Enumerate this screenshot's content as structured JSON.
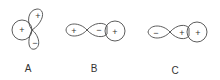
{
  "diagrams": [
    {
      "label": "A",
      "signs": {
        "left_sphere": "+",
        "upper_lobe": "+",
        "lower_lobe": "−"
      }
    },
    {
      "label": "B",
      "signs": {
        "left_lobe": "+",
        "right_lobe": "−",
        "sphere": "+"
      }
    },
    {
      "label": "C",
      "signs": {
        "left_lobe": "−",
        "right_lobe": "+",
        "sphere": "+"
      }
    }
  ],
  "colors": {
    "stroke": "#4a4a4a",
    "text": "#333333",
    "background": "#ffffff"
  }
}
